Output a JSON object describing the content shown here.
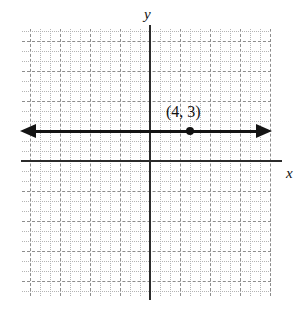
{
  "figure": {
    "kind": "coordinate-plane",
    "background_color": "#ffffff",
    "axis_color": "#2b2b2b",
    "grid_minor_color": "#b4b4b4",
    "grid_major_color": "#8d8d8d",
    "ink_color": "#141414"
  },
  "axes": {
    "y_label": "y",
    "x_label": "x",
    "origin_px": {
      "x": 150,
      "y": 161
    },
    "unit_px": 10,
    "x_range": [
      -12.8,
      12.1
    ],
    "y_range": [
      -13.5,
      13.2
    ]
  },
  "grid": {
    "left_px": 22,
    "top_px": 29,
    "width_px": 249,
    "height_px": 267,
    "minor_spacing_px": 10,
    "major_every": 3,
    "style": "dotted"
  },
  "chart_data": {
    "type": "scatter",
    "title": "",
    "xlabel": "x",
    "ylabel": "y",
    "xlim": [
      -12.8,
      12.1
    ],
    "ylim": [
      -13.5,
      13.2
    ],
    "grid": true,
    "legend": false,
    "series": [
      {
        "name": "horizontal line y = 3",
        "kind": "line",
        "equation": "y = 3",
        "arrows": "both",
        "x": [
          -13,
          12
        ],
        "values": [
          3,
          3
        ]
      },
      {
        "name": "plotted point",
        "kind": "point",
        "x": [
          4
        ],
        "values": [
          3
        ]
      }
    ],
    "annotations": [
      {
        "text": "(4, 3)",
        "x": 4,
        "y": 3,
        "position": "above-left"
      }
    ]
  },
  "point": {
    "label": "(4, 3)",
    "x": 4,
    "y": 3
  }
}
